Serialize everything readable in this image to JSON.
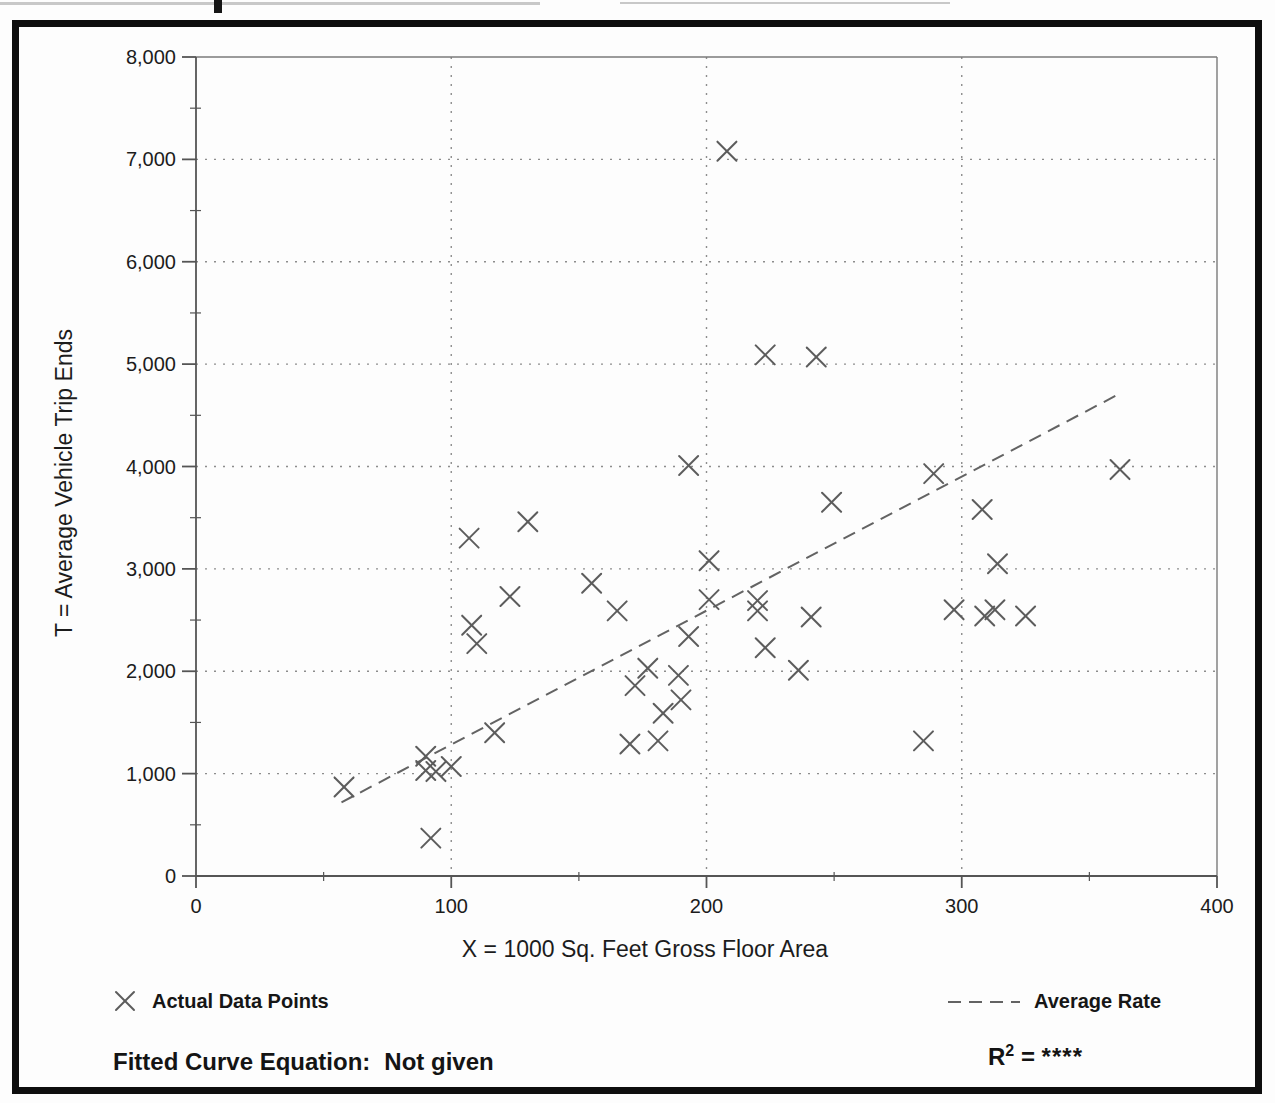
{
  "chart_data": {
    "type": "scatter",
    "title": "",
    "xlabel": "X = 1000 Sq. Feet Gross Floor Area",
    "ylabel": "T = Average Vehicle Trip Ends",
    "xlim": [
      0,
      400
    ],
    "ylim": [
      0,
      8000
    ],
    "x_ticks": [
      0,
      100,
      200,
      300,
      400
    ],
    "x_tick_labels": [
      "0",
      "100",
      "200",
      "300",
      "400"
    ],
    "x_minor_ticks": [
      50,
      150,
      250,
      350
    ],
    "y_ticks": [
      0,
      1000,
      2000,
      3000,
      4000,
      5000,
      6000,
      7000,
      8000
    ],
    "y_tick_labels": [
      "0",
      "1,000",
      "2,000",
      "3,000",
      "4,000",
      "5,000",
      "6,000",
      "7,000",
      "8,000"
    ],
    "y_minor_ticks": [
      500,
      1500,
      2500,
      3500,
      4500,
      5500,
      6500,
      7500
    ],
    "grid": "dotted",
    "grid_x_values": [
      100,
      200,
      300
    ],
    "grid_y_values": [
      1000,
      2000,
      3000,
      4000,
      5000,
      6000,
      7000
    ],
    "marker": "x",
    "marker_color": "#5c5c5c",
    "points": [
      [
        58,
        870
      ],
      [
        90,
        1170
      ],
      [
        90,
        1030
      ],
      [
        94,
        1020
      ],
      [
        100,
        1070
      ],
      [
        92,
        370
      ],
      [
        117,
        1400
      ],
      [
        107,
        3300
      ],
      [
        130,
        3460
      ],
      [
        123,
        2730
      ],
      [
        155,
        2860
      ],
      [
        108,
        2450
      ],
      [
        110,
        2270
      ],
      [
        165,
        2590
      ],
      [
        172,
        1860
      ],
      [
        177,
        2030
      ],
      [
        170,
        1290
      ],
      [
        181,
        1320
      ],
      [
        183,
        1590
      ],
      [
        190,
        1720
      ],
      [
        189,
        1960
      ],
      [
        193,
        2340
      ],
      [
        193,
        4010
      ],
      [
        201,
        3080
      ],
      [
        201,
        2700
      ],
      [
        208,
        7080
      ],
      [
        220,
        2690
      ],
      [
        220,
        2590
      ],
      [
        223,
        2230
      ],
      [
        223,
        5090
      ],
      [
        236,
        2010
      ],
      [
        241,
        2530
      ],
      [
        243,
        5070
      ],
      [
        249,
        3650
      ],
      [
        285,
        1320
      ],
      [
        289,
        3930
      ],
      [
        297,
        2600
      ],
      [
        308,
        3580
      ],
      [
        309,
        2540
      ],
      [
        313,
        2600
      ],
      [
        314,
        3050
      ],
      [
        325,
        2540
      ],
      [
        362,
        3970
      ]
    ],
    "average_rate_line": {
      "x1": 57,
      "y1": 720,
      "x2": 361,
      "y2": 4700,
      "style": "dashed",
      "color": "#636363"
    },
    "legend": {
      "actual": {
        "marker": "x",
        "label": "Actual Data Points"
      },
      "average": {
        "marker": "dashed-line",
        "label": "Average Rate"
      }
    },
    "footer": {
      "equation_label": "Fitted Curve Equation:",
      "equation_value": "Not given",
      "r2_base": "R",
      "r2_sup": "2",
      "r2_eq": "=",
      "r2_value": "****"
    }
  }
}
